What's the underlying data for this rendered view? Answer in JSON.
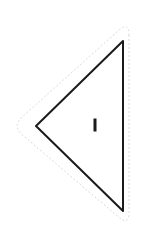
{
  "canvas": {
    "width": 153,
    "height": 234,
    "background_color": "#ffffff"
  },
  "shape": {
    "name": "triangle",
    "orientation": "left-pointing",
    "stroke_color": "#1a1a1a",
    "stroke_width": 2,
    "fill": "none",
    "vertices": [
      {
        "label": "apex-top-right",
        "x": 123,
        "y": 41
      },
      {
        "label": "apex-left",
        "x": 36,
        "y": 126
      },
      {
        "label": "apex-bottom-right",
        "x": 123,
        "y": 211
      }
    ]
  },
  "selection_outline": {
    "name": "dotted-offset-outline",
    "stroke_color": "#d7d7d7",
    "stroke_width": 1,
    "dash_pattern": "1 3",
    "corner_radius": 14,
    "offset": 18,
    "fill": "none",
    "vertices": [
      {
        "label": "outline-top-right",
        "x": 129,
        "y": 21
      },
      {
        "label": "outline-left",
        "x": 12,
        "y": 126
      },
      {
        "label": "outline-bottom-right",
        "x": 129,
        "y": 226
      }
    ]
  },
  "center_mark": {
    "name": "center-tick",
    "glyph": "I",
    "color": "#1b1b1b",
    "x": 95,
    "y": 125,
    "width": 3,
    "height": 13
  }
}
